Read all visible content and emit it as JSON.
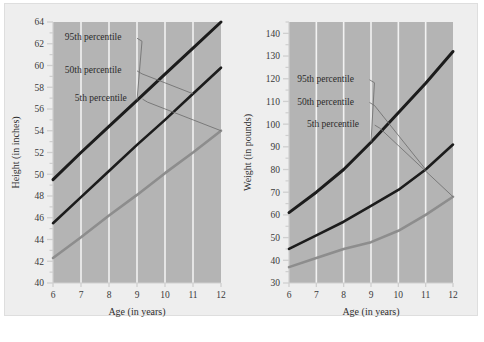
{
  "figure": {
    "background_color": "#eeeeee",
    "plot_background_color": "#b4b4b4",
    "gridline_color": "#f2f2f2",
    "axis_color": "#cfcfcf"
  },
  "chart_data": [
    {
      "type": "line",
      "panel": "left",
      "title": "",
      "xlabel": "Age (in years)",
      "ylabel": "Height (in inches)",
      "x": [
        6,
        7,
        8,
        9,
        10,
        11,
        12
      ],
      "xlim": [
        6,
        12
      ],
      "xticks": [
        6,
        7,
        8,
        9,
        10,
        11,
        12
      ],
      "xtick_labels": [
        "6",
        "7",
        "8",
        "9",
        "10",
        "11",
        "12"
      ],
      "ylim": [
        40,
        64
      ],
      "yticks": [
        40,
        42,
        44,
        46,
        48,
        50,
        52,
        54,
        56,
        58,
        60,
        62,
        64
      ],
      "ytick_labels": [
        "40",
        "42",
        "44",
        "46",
        "48",
        "50",
        "52",
        "54",
        "56",
        "58",
        "60",
        "62",
        "64"
      ],
      "minor_ytick_step": 1,
      "grid": "vertical-only",
      "legend_position": "in-plot-annotations",
      "series": [
        {
          "name": "95th percentile",
          "color": "#1c1c1c",
          "width": 3.0,
          "values": [
            49.5,
            52.0,
            54.4,
            56.8,
            59.2,
            61.6,
            64.0
          ]
        },
        {
          "name": "50th percentile",
          "color": "#1c1c1c",
          "width": 2.6,
          "values": [
            45.5,
            47.9,
            50.3,
            52.7,
            55.0,
            57.4,
            59.8
          ]
        },
        {
          "name": "5th percentile",
          "color": "#8d8d8d",
          "width": 2.6,
          "values": [
            42.3,
            44.2,
            46.2,
            48.1,
            50.1,
            52.0,
            54.0
          ]
        }
      ],
      "annotations": [
        {
          "text": "95th percentile",
          "x_frac": 0.07,
          "y_value": 62.6
        },
        {
          "text": "50th percentile",
          "x_frac": 0.07,
          "y_value": 59.6
        },
        {
          "text": "5th percentile",
          "x_frac": 0.13,
          "y_value": 57.0
        }
      ]
    },
    {
      "type": "line",
      "panel": "right",
      "title": "",
      "xlabel": "Age (in years)",
      "ylabel": "Weight (in pounds)",
      "x": [
        6,
        7,
        8,
        9,
        10,
        11,
        12
      ],
      "xlim": [
        6,
        12
      ],
      "xticks": [
        6,
        7,
        8,
        9,
        10,
        11,
        12
      ],
      "xtick_labels": [
        "6",
        "7",
        "8",
        "9",
        "10",
        "11",
        "12"
      ],
      "ylim": [
        30,
        145
      ],
      "yticks": [
        30,
        40,
        50,
        60,
        70,
        80,
        90,
        100,
        110,
        120,
        130,
        140
      ],
      "ytick_labels": [
        "30",
        "40",
        "50",
        "60",
        "70",
        "80",
        "90",
        "100",
        "110",
        "120",
        "130",
        "140"
      ],
      "minor_ytick_step": 5,
      "grid": "vertical-only",
      "legend_position": "in-plot-annotations",
      "series": [
        {
          "name": "95th percentile",
          "color": "#1c1c1c",
          "width": 3.0,
          "values": [
            61,
            70,
            80,
            92,
            105,
            118,
            132
          ]
        },
        {
          "name": "50th percentile",
          "color": "#1c1c1c",
          "width": 2.6,
          "values": [
            45,
            51,
            57,
            64,
            71,
            80,
            91
          ]
        },
        {
          "name": "5th percentile",
          "color": "#8d8d8d",
          "width": 2.6,
          "values": [
            37,
            41,
            45,
            48,
            53,
            60,
            68
          ]
        }
      ],
      "annotations": [
        {
          "text": "95th percentile",
          "x_frac": 0.05,
          "y_value": 120
        },
        {
          "text": "50th percentile",
          "x_frac": 0.05,
          "y_value": 110
        },
        {
          "text": "5th percentile",
          "x_frac": 0.11,
          "y_value": 100
        }
      ]
    }
  ]
}
